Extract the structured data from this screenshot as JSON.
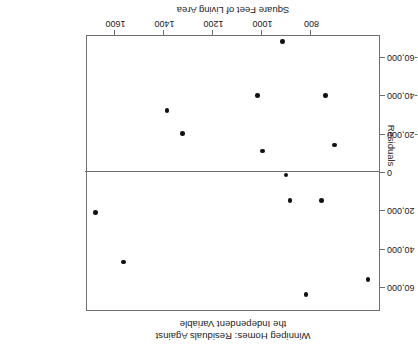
{
  "chart_data": {
    "type": "scatter",
    "title": "Winnipeg Homes: Residuals Against the Independent Variable",
    "title_lines": [
      "Winnipeg Homes: Residuals Against",
      "the Independent Variable"
    ],
    "xlabel": "Square Feet of Living Area",
    "ylabel": "Residuals",
    "orientation": "rotated-180",
    "grid": false,
    "legend": null,
    "xlim": [
      520,
      1720
    ],
    "ylim": [
      -72000,
      72000
    ],
    "xticks": [
      1600,
      1400,
      1200,
      1000,
      800
    ],
    "xtick_labels": [
      "1600",
      "1400",
      "1200",
      "1000",
      "800"
    ],
    "yticks": [
      -60000,
      -40000,
      -20000,
      0,
      20000,
      40000,
      60000
    ],
    "ytick_labels": [
      "-60,000",
      "-40,000",
      "-20,000",
      "0",
      "20,000",
      "40,000",
      "60,000"
    ],
    "reference_line": {
      "axis": "y",
      "value": 0,
      "label": "zero-residual-line"
    },
    "points": [
      {
        "x": 1564,
        "y": 47000
      },
      {
        "x": 1677,
        "y": 21000
      },
      {
        "x": 818,
        "y": 64000
      },
      {
        "x": 565,
        "y": 56000
      },
      {
        "x": 883,
        "y": 15000
      },
      {
        "x": 754,
        "y": 15000
      },
      {
        "x": 899,
        "y": 1500
      },
      {
        "x": 996,
        "y": -11000
      },
      {
        "x": 701,
        "y": -14000
      },
      {
        "x": 1321,
        "y": -20000
      },
      {
        "x": 1386,
        "y": -32000
      },
      {
        "x": 1016,
        "y": -40000
      },
      {
        "x": 738,
        "y": -40000
      },
      {
        "x": 915,
        "y": -68000
      }
    ],
    "point_color": "#111111",
    "axis_color": "#6f6f6f",
    "background_color": "#ffffff"
  }
}
